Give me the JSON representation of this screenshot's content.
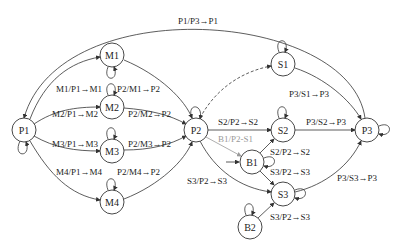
{
  "nodes": {
    "P1": "P1",
    "M1": "M1",
    "M2": "M2",
    "M3": "M3",
    "M4": "M4",
    "P2": "P2",
    "S1": "S1",
    "S2": "S2",
    "S3": "S3",
    "B1": "B1",
    "B2": "B2",
    "P3": "P3"
  },
  "labels": {
    "p1_p3": "P1/P3→P1",
    "m1_p1": "M1/P1→M1",
    "p2_m1": "P2/M1→P2",
    "m2_p1": "M2/P1→M2",
    "p2_m2": "P2/M2→P2",
    "m3_p1": "M3/P1→M3",
    "p2_m3": "P2/M3→P2",
    "m4_p1": "M4/P1→M4",
    "p2_m4": "P2/M4→P2",
    "s2_p2": "S2/P2→S2",
    "b1_p2": "B1/P2-S1",
    "s3_p2_left": "S3/P2→S3",
    "p3_s1": "P3/S1→P3",
    "p3_s2": "P3/S2→P3",
    "s2_p2_b1": "S2/P2→S2",
    "s3_p2_b1": "S3/P2→S3",
    "p3_s3": "P3/S3→P3",
    "s3_p2_b2": "S3/P2→S3"
  }
}
